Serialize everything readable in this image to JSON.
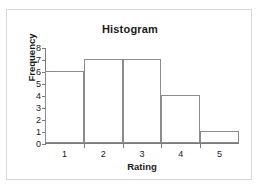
{
  "chart_data": {
    "type": "bar",
    "title": "Histogram",
    "xlabel": "Rating",
    "ylabel": "Frequency",
    "categories": [
      "1",
      "2",
      "3",
      "4",
      "5"
    ],
    "values": [
      6,
      7,
      7,
      4,
      1
    ],
    "ylim": [
      0,
      8
    ],
    "yticks": [
      "0",
      "1",
      "2",
      "3",
      "4",
      "5",
      "6",
      "7",
      "8"
    ],
    "grid": false,
    "legend": "none",
    "bar_style": "outlined",
    "bar_gap": 0
  },
  "style": {
    "frame_border": "#d9d9d9",
    "axis_color": "#7a7a7a",
    "bar_stroke": "#8c8c8c",
    "bar_fill": "#ffffff",
    "text_color": "#1a1a1a",
    "background": "#ffffff"
  }
}
